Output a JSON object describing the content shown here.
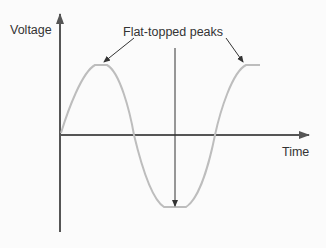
{
  "diagram": {
    "type": "waveform",
    "y_axis_label": "Voltage",
    "x_axis_label": "Time",
    "annotation": "Flat-topped peaks",
    "colors": {
      "axis": "#555555",
      "waveform": "#bdbdbd",
      "text": "#333333",
      "arrow": "#333333",
      "background": "#fbfbfb"
    },
    "waveform": {
      "shape": "sine wave with clipped (flat-topped) peaks and trough",
      "cycles": 1.25
    }
  }
}
